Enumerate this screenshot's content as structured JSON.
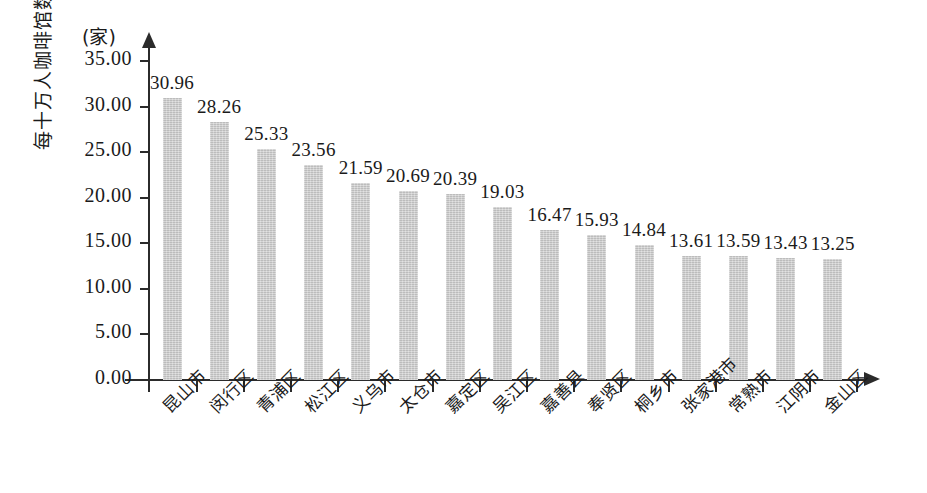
{
  "chart_data": {
    "type": "bar",
    "title": "",
    "unit_label": "(家)",
    "ylabel": "每十万人咖啡馆数",
    "xlabel": "",
    "ylim": [
      0,
      35
    ],
    "ytick_labels": [
      "35.00",
      "30.00",
      "25.00",
      "20.00",
      "15.00",
      "10.00",
      "5.00",
      "0.00"
    ],
    "ytick_values": [
      35,
      30,
      25,
      20,
      15,
      10,
      5,
      0
    ],
    "grid": false,
    "legend": false,
    "bar_color": "#c9c9c9",
    "axis_color": "#2b2b2b",
    "categories": [
      "昆山市",
      "闵行区",
      "青浦区",
      "松江区",
      "义乌市",
      "太仓市",
      "嘉定区",
      "吴江区",
      "嘉善县",
      "奉贤区",
      "桐乡市",
      "张家港市",
      "常熟市",
      "江阴市",
      "金山区"
    ],
    "values": [
      30.96,
      28.26,
      25.33,
      23.56,
      21.59,
      20.69,
      20.39,
      19.03,
      16.47,
      15.93,
      14.84,
      13.61,
      13.59,
      13.43,
      13.25
    ],
    "value_labels": [
      "30.96",
      "28.26",
      "25.33",
      "23.56",
      "21.59",
      "20.69",
      "20.39",
      "19.03",
      "16.47",
      "15.93",
      "14.84",
      "13.61",
      "13.59",
      "13.43",
      "13.25"
    ]
  }
}
